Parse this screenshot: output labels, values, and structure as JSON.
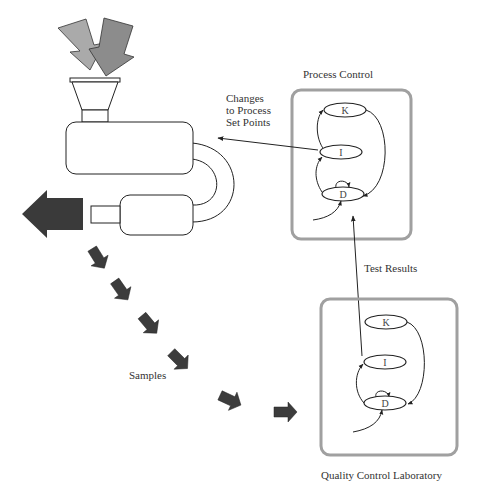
{
  "diagram": {
    "labels": {
      "changes_line1": "Changes",
      "changes_line2": "to Process",
      "changes_line3": "Set Points",
      "process_control": "Process Control",
      "test_results": "Test Results",
      "samples": "Samples",
      "quality_control_lab": "Quality Control Laboratory"
    },
    "process_control_box": {
      "nodes": [
        {
          "id": "K",
          "label": "K"
        },
        {
          "id": "I",
          "label": "I"
        },
        {
          "id": "D",
          "label": "D"
        }
      ]
    },
    "qc_lab_box": {
      "nodes": [
        {
          "id": "K",
          "label": "K"
        },
        {
          "id": "I",
          "label": "I"
        },
        {
          "id": "D",
          "label": "D"
        }
      ]
    },
    "edges": [
      {
        "from": "I",
        "to": "K"
      },
      {
        "from": "K",
        "to": "D"
      },
      {
        "from": "D",
        "to": "I"
      },
      {
        "from": "D",
        "to": "D"
      },
      {
        "from": "external",
        "to": "D"
      },
      {
        "from": "process_control.I",
        "to": "machine",
        "label": "Changes to Process Set Points"
      },
      {
        "from": "qc_lab.I",
        "to": "process_control.D",
        "label": "Test Results"
      },
      {
        "from": "machine",
        "to": "qc_lab",
        "label": "Samples"
      }
    ],
    "colors": {
      "input_arrow_light": "#a8a8a8",
      "input_arrow_dark": "#8a8a8a",
      "output_arrow": "#3a3a3a",
      "sample_arrow": "#3c3c3c",
      "box_border": "#a0a0a0",
      "stroke": "#222222"
    }
  }
}
